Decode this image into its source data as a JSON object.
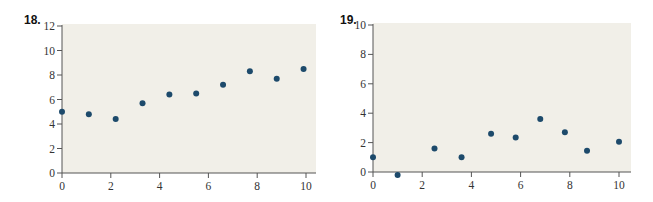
{
  "chart_data": [
    {
      "type": "scatter",
      "title": "18.",
      "xlabel": "",
      "ylabel": "",
      "xlim": [
        0,
        10
      ],
      "ylim": [
        0,
        12
      ],
      "xticks": [
        0,
        2,
        4,
        6,
        8,
        10
      ],
      "yticks": [
        0,
        2,
        4,
        6,
        8,
        10,
        12
      ],
      "grid": false,
      "legend": null,
      "series": [
        {
          "name": "points",
          "color": "#1d4a6b",
          "x": [
            0,
            1.1,
            2.2,
            3.3,
            4.4,
            5.5,
            6.6,
            7.7,
            8.8,
            9.9
          ],
          "y": [
            5.0,
            4.8,
            4.4,
            5.7,
            6.4,
            6.5,
            7.2,
            8.3,
            7.7,
            8.5
          ]
        }
      ]
    },
    {
      "type": "scatter",
      "title": "19.",
      "xlabel": "",
      "ylabel": "",
      "xlim": [
        0,
        10
      ],
      "ylim": [
        0,
        10
      ],
      "xticks": [
        0,
        2,
        4,
        6,
        8,
        10
      ],
      "yticks": [
        0,
        2,
        4,
        6,
        8,
        10
      ],
      "grid": false,
      "legend": null,
      "series": [
        {
          "name": "points",
          "color": "#1d4a6b",
          "x": [
            0,
            1.0,
            2.5,
            3.6,
            4.8,
            5.8,
            6.8,
            7.8,
            8.7,
            10.0
          ],
          "y": [
            1.0,
            -0.2,
            1.6,
            1.0,
            2.6,
            2.35,
            3.6,
            2.7,
            1.45,
            2.05
          ]
        }
      ]
    }
  ],
  "figures": [
    {
      "number": "18."
    },
    {
      "number": "19."
    }
  ],
  "colors": {
    "plot_bg": "#f1efe8",
    "axis": "#555555",
    "point": "#1d4a6b"
  }
}
